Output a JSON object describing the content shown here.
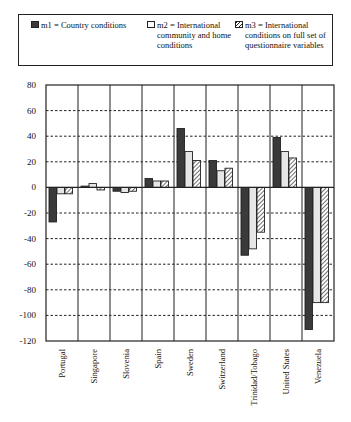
{
  "legend": {
    "items": [
      {
        "key": "m1",
        "label_lines": [
          "m1 = Country conditions"
        ]
      },
      {
        "key": "m2",
        "label_lines": [
          "m2 = International",
          "community and home",
          "conditions"
        ]
      },
      {
        "key": "m3",
        "label_lines": [
          "m3 = International",
          "conditions on full set of",
          "questionnaire variables"
        ]
      }
    ]
  },
  "colors": {
    "m1": "#3a3a3a",
    "m2": "#e6e6e6",
    "m3": "hatch",
    "grid": "#222222",
    "axis": "#222222"
  },
  "chart_data": {
    "type": "bar",
    "title": "",
    "xlabel": "",
    "ylabel": "",
    "ylim": [
      -120,
      80
    ],
    "yticks": [
      80,
      60,
      40,
      20,
      0,
      -20,
      -40,
      -60,
      -80,
      -100,
      -120
    ],
    "grid": "horizontal dashed",
    "legend_position": "top",
    "categories": [
      "Portugal",
      "Singapore",
      "Slovenia",
      "Spain",
      "Sweden",
      "Switzerland",
      "Trinidad/Tobago",
      "United States",
      "Venezuela"
    ],
    "series": [
      {
        "name": "m1 = Country conditions",
        "values": [
          -27,
          1,
          -3,
          7,
          46,
          21,
          -53,
          39,
          -111
        ]
      },
      {
        "name": "m2 = International community and home conditions",
        "values": [
          -5,
          3,
          -4,
          5,
          28,
          13,
          -48,
          28,
          -90
        ]
      },
      {
        "name": "m3 = International conditions on full set of questionnaire variables",
        "values": [
          -5,
          -2,
          -3,
          5,
          21,
          15,
          -35,
          23,
          -90
        ]
      }
    ]
  }
}
